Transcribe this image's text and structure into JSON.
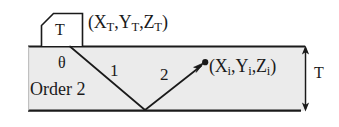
{
  "figure": {
    "name": "ray-path-diagram-order-2",
    "background_color": "#ffffff",
    "slab_fill_color": "#ebebeb",
    "line_color": "#1a1a1a",
    "width": 339,
    "height": 127
  },
  "transmitter": {
    "box_label": "T",
    "coordinate_label": "(Xᴛ,Yᴛ,Zᴛ)",
    "coord_x": "X",
    "coord_y": "Y",
    "coord_z": "Z",
    "coord_subscript": "T"
  },
  "receiver": {
    "coordinate_label": "(Xᵢ,Yᵢ,Zᵢ)",
    "coord_x": "X",
    "coord_y": "Y",
    "coord_z": "Z",
    "coord_subscript": "i",
    "marker": "filled-dot"
  },
  "angles": {
    "incidence_symbol": "θ"
  },
  "rays": [
    {
      "id": "ray-1",
      "label": "1",
      "description": "incident-ray-downward"
    },
    {
      "id": "ray-2",
      "label": "2",
      "description": "reflected-ray-upward-to-receiver"
    }
  ],
  "annotations": {
    "order_label": "Order 2",
    "thickness_label": "T"
  },
  "geometry": {
    "slab_left": 28,
    "slab_right": 305,
    "slab_top": 46,
    "slab_bottom": 111,
    "ray_origin": {
      "x": 70,
      "y": 46
    },
    "ray_vertex": {
      "x": 145,
      "y": 110
    },
    "ray_end": {
      "x": 204,
      "y": 63
    },
    "dimension_line_x": 305
  }
}
